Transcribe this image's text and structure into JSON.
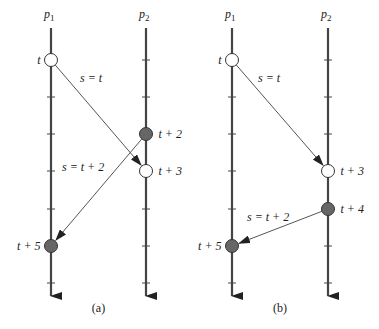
{
  "colors": {
    "line": "#444444",
    "message": "#555555",
    "filled_node": "#666666",
    "open_node": "#ffffff",
    "text": "#222222"
  },
  "panels": [
    {
      "id": "a",
      "caption": "(a)",
      "processes": [
        {
          "name": "p",
          "sub": "1",
          "x": 51
        },
        {
          "name": "p",
          "sub": "2",
          "x": 146
        }
      ],
      "events": [
        {
          "process": 0,
          "y": 60,
          "filled": false,
          "label": "t",
          "label_side": "left"
        },
        {
          "process": 1,
          "y": 134,
          "filled": true,
          "label": "t + 2",
          "label_side": "right"
        },
        {
          "process": 1,
          "y": 171,
          "filled": false,
          "label": "t + 3",
          "label_side": "right"
        },
        {
          "process": 0,
          "y": 246,
          "filled": true,
          "label": "t + 5",
          "label_side": "left"
        }
      ],
      "messages": [
        {
          "from": 0,
          "to": 2,
          "label": "s = t",
          "label_x": 80,
          "label_y": 82
        },
        {
          "from": 1,
          "to": 3,
          "label": "s = t + 2",
          "label_x": 62,
          "label_y": 171
        }
      ]
    },
    {
      "id": "b",
      "caption": "(b)",
      "processes": [
        {
          "name": "p",
          "sub": "1",
          "x": 232
        },
        {
          "name": "p",
          "sub": "2",
          "x": 328
        }
      ],
      "events": [
        {
          "process": 0,
          "y": 60,
          "filled": false,
          "label": "t",
          "label_side": "left"
        },
        {
          "process": 1,
          "y": 171,
          "filled": false,
          "label": "t + 3",
          "label_side": "right"
        },
        {
          "process": 1,
          "y": 209,
          "filled": true,
          "label": "t + 4",
          "label_side": "right"
        },
        {
          "process": 0,
          "y": 246,
          "filled": true,
          "label": "t + 5",
          "label_side": "left"
        }
      ],
      "messages": [
        {
          "from": 0,
          "to": 1,
          "label": "s = t",
          "label_x": 258,
          "label_y": 82
        },
        {
          "from": 2,
          "to": 3,
          "label": "s = t + 2",
          "label_x": 247,
          "label_y": 221
        }
      ]
    }
  ],
  "timeline": {
    "top": 28,
    "bottom": 296,
    "tick_ys": [
      60,
      97,
      134,
      171,
      209,
      246,
      283
    ],
    "label_y": 18,
    "caption_y": 312
  }
}
